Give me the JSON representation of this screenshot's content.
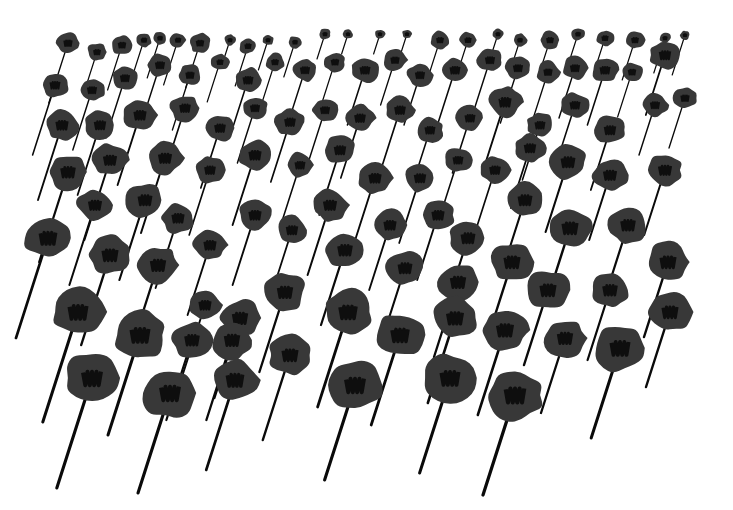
{
  "artwork": {
    "subject": "Field of dark poppies with long slanted stems",
    "background_color": "#ffffff",
    "petal_color": "#383838",
    "center_color": "#0e0e0e",
    "stem_color": "#0a0a0a",
    "stem_lean": 0.32
  },
  "flowers": [
    {
      "x": 68,
      "y": 43,
      "r": 12,
      "len": 60
    },
    {
      "x": 97,
      "y": 52,
      "r": 10,
      "len": 35
    },
    {
      "x": 122,
      "y": 45,
      "r": 11,
      "len": 45
    },
    {
      "x": 144,
      "y": 40,
      "r": 8,
      "len": 40
    },
    {
      "x": 160,
      "y": 38,
      "r": 7,
      "len": 40
    },
    {
      "x": 178,
      "y": 40,
      "r": 8,
      "len": 45
    },
    {
      "x": 200,
      "y": 43,
      "r": 11,
      "len": 45
    },
    {
      "x": 230,
      "y": 40,
      "r": 6,
      "len": 25
    },
    {
      "x": 248,
      "y": 46,
      "r": 9,
      "len": 40
    },
    {
      "x": 268,
      "y": 40,
      "r": 6,
      "len": 30
    },
    {
      "x": 295,
      "y": 42,
      "r": 7,
      "len": 35
    },
    {
      "x": 325,
      "y": 34,
      "r": 6,
      "len": 25
    },
    {
      "x": 348,
      "y": 34,
      "r": 5,
      "len": 20
    },
    {
      "x": 380,
      "y": 34,
      "r": 5,
      "len": 20
    },
    {
      "x": 407,
      "y": 34,
      "r": 5,
      "len": 20
    },
    {
      "x": 440,
      "y": 40,
      "r": 10,
      "len": 40
    },
    {
      "x": 468,
      "y": 40,
      "r": 9,
      "len": 40
    },
    {
      "x": 498,
      "y": 34,
      "r": 6,
      "len": 25
    },
    {
      "x": 520,
      "y": 40,
      "r": 7,
      "len": 30
    },
    {
      "x": 550,
      "y": 40,
      "r": 10,
      "len": 35
    },
    {
      "x": 578,
      "y": 34,
      "r": 7,
      "len": 30
    },
    {
      "x": 605,
      "y": 38,
      "r": 9,
      "len": 35
    },
    {
      "x": 635,
      "y": 40,
      "r": 10,
      "len": 40
    },
    {
      "x": 665,
      "y": 38,
      "r": 6,
      "len": 35
    },
    {
      "x": 685,
      "y": 35,
      "r": 5,
      "len": 40
    },
    {
      "x": 55,
      "y": 85,
      "r": 14,
      "len": 70
    },
    {
      "x": 92,
      "y": 90,
      "r": 13,
      "len": 60
    },
    {
      "x": 125,
      "y": 78,
      "r": 13,
      "len": 60
    },
    {
      "x": 160,
      "y": 65,
      "r": 13,
      "len": 60
    },
    {
      "x": 190,
      "y": 75,
      "r": 12,
      "len": 55
    },
    {
      "x": 220,
      "y": 62,
      "r": 9,
      "len": 40
    },
    {
      "x": 248,
      "y": 80,
      "r": 14,
      "len": 55
    },
    {
      "x": 275,
      "y": 62,
      "r": 10,
      "len": 45
    },
    {
      "x": 305,
      "y": 70,
      "r": 13,
      "len": 50
    },
    {
      "x": 335,
      "y": 62,
      "r": 11,
      "len": 45
    },
    {
      "x": 365,
      "y": 70,
      "r": 14,
      "len": 55
    },
    {
      "x": 395,
      "y": 60,
      "r": 12,
      "len": 45
    },
    {
      "x": 420,
      "y": 75,
      "r": 13,
      "len": 50
    },
    {
      "x": 455,
      "y": 70,
      "r": 14,
      "len": 55
    },
    {
      "x": 490,
      "y": 60,
      "r": 13,
      "len": 50
    },
    {
      "x": 518,
      "y": 68,
      "r": 13,
      "len": 55
    },
    {
      "x": 548,
      "y": 72,
      "r": 12,
      "len": 50
    },
    {
      "x": 575,
      "y": 68,
      "r": 13,
      "len": 50
    },
    {
      "x": 605,
      "y": 70,
      "r": 14,
      "len": 55
    },
    {
      "x": 632,
      "y": 72,
      "r": 11,
      "len": 45
    },
    {
      "x": 665,
      "y": 55,
      "r": 16,
      "len": 60
    },
    {
      "x": 685,
      "y": 98,
      "r": 12,
      "len": 50
    },
    {
      "x": 62,
      "y": 125,
      "r": 17,
      "len": 75
    },
    {
      "x": 100,
      "y": 125,
      "r": 16,
      "len": 70
    },
    {
      "x": 140,
      "y": 115,
      "r": 17,
      "len": 70
    },
    {
      "x": 185,
      "y": 108,
      "r": 15,
      "len": 65
    },
    {
      "x": 220,
      "y": 128,
      "r": 15,
      "len": 60
    },
    {
      "x": 255,
      "y": 108,
      "r": 13,
      "len": 55
    },
    {
      "x": 290,
      "y": 122,
      "r": 15,
      "len": 60
    },
    {
      "x": 325,
      "y": 110,
      "r": 13,
      "len": 55
    },
    {
      "x": 360,
      "y": 118,
      "r": 15,
      "len": 60
    },
    {
      "x": 400,
      "y": 110,
      "r": 15,
      "len": 60
    },
    {
      "x": 430,
      "y": 130,
      "r": 14,
      "len": 55
    },
    {
      "x": 470,
      "y": 118,
      "r": 14,
      "len": 55
    },
    {
      "x": 505,
      "y": 102,
      "r": 17,
      "len": 65
    },
    {
      "x": 540,
      "y": 125,
      "r": 14,
      "len": 55
    },
    {
      "x": 575,
      "y": 105,
      "r": 14,
      "len": 55
    },
    {
      "x": 610,
      "y": 130,
      "r": 16,
      "len": 60
    },
    {
      "x": 655,
      "y": 105,
      "r": 13,
      "len": 50
    },
    {
      "x": 68,
      "y": 172,
      "r": 20,
      "len": 90
    },
    {
      "x": 110,
      "y": 160,
      "r": 18,
      "len": 80
    },
    {
      "x": 165,
      "y": 158,
      "r": 18,
      "len": 75
    },
    {
      "x": 210,
      "y": 170,
      "r": 15,
      "len": 65
    },
    {
      "x": 255,
      "y": 155,
      "r": 17,
      "len": 70
    },
    {
      "x": 300,
      "y": 165,
      "r": 14,
      "len": 60
    },
    {
      "x": 340,
      "y": 150,
      "r": 16,
      "len": 65
    },
    {
      "x": 375,
      "y": 178,
      "r": 17,
      "len": 65
    },
    {
      "x": 420,
      "y": 178,
      "r": 16,
      "len": 65
    },
    {
      "x": 458,
      "y": 160,
      "r": 14,
      "len": 55
    },
    {
      "x": 495,
      "y": 170,
      "r": 15,
      "len": 60
    },
    {
      "x": 530,
      "y": 148,
      "r": 16,
      "len": 60
    },
    {
      "x": 568,
      "y": 162,
      "r": 19,
      "len": 70
    },
    {
      "x": 610,
      "y": 175,
      "r": 18,
      "len": 65
    },
    {
      "x": 665,
      "y": 170,
      "r": 18,
      "len": 65
    },
    {
      "x": 48,
      "y": 238,
      "r": 24,
      "len": 100
    },
    {
      "x": 95,
      "y": 205,
      "r": 18,
      "len": 80
    },
    {
      "x": 145,
      "y": 200,
      "r": 19,
      "len": 80
    },
    {
      "x": 178,
      "y": 218,
      "r": 17,
      "len": 70
    },
    {
      "x": 210,
      "y": 245,
      "r": 17,
      "len": 70
    },
    {
      "x": 255,
      "y": 215,
      "r": 17,
      "len": 70
    },
    {
      "x": 292,
      "y": 230,
      "r": 16,
      "len": 65
    },
    {
      "x": 330,
      "y": 205,
      "r": 18,
      "len": 70
    },
    {
      "x": 345,
      "y": 250,
      "r": 20,
      "len": 75
    },
    {
      "x": 390,
      "y": 225,
      "r": 17,
      "len": 65
    },
    {
      "x": 438,
      "y": 215,
      "r": 17,
      "len": 65
    },
    {
      "x": 468,
      "y": 238,
      "r": 19,
      "len": 70
    },
    {
      "x": 525,
      "y": 200,
      "r": 19,
      "len": 70
    },
    {
      "x": 570,
      "y": 228,
      "r": 22,
      "len": 75
    },
    {
      "x": 628,
      "y": 225,
      "r": 20,
      "len": 70
    },
    {
      "x": 668,
      "y": 262,
      "r": 22,
      "len": 75
    },
    {
      "x": 110,
      "y": 255,
      "r": 22,
      "len": 90
    },
    {
      "x": 158,
      "y": 265,
      "r": 21,
      "len": 85
    },
    {
      "x": 205,
      "y": 305,
      "r": 17,
      "len": 70
    },
    {
      "x": 240,
      "y": 318,
      "r": 21,
      "len": 80
    },
    {
      "x": 285,
      "y": 292,
      "r": 21,
      "len": 80
    },
    {
      "x": 405,
      "y": 268,
      "r": 19,
      "len": 70
    },
    {
      "x": 458,
      "y": 282,
      "r": 21,
      "len": 75
    },
    {
      "x": 512,
      "y": 262,
      "r": 22,
      "len": 75
    },
    {
      "x": 548,
      "y": 290,
      "r": 22,
      "len": 75
    },
    {
      "x": 610,
      "y": 290,
      "r": 20,
      "len": 70
    },
    {
      "x": 670,
      "y": 312,
      "r": 22,
      "len": 75
    },
    {
      "x": 78,
      "y": 312,
      "r": 27,
      "len": 110
    },
    {
      "x": 140,
      "y": 335,
      "r": 27,
      "len": 100
    },
    {
      "x": 192,
      "y": 340,
      "r": 20,
      "len": 80
    },
    {
      "x": 232,
      "y": 340,
      "r": 21,
      "len": 80
    },
    {
      "x": 290,
      "y": 355,
      "r": 22,
      "len": 85
    },
    {
      "x": 348,
      "y": 312,
      "r": 25,
      "len": 95
    },
    {
      "x": 400,
      "y": 335,
      "r": 25,
      "len": 90
    },
    {
      "x": 455,
      "y": 318,
      "r": 23,
      "len": 85
    },
    {
      "x": 505,
      "y": 330,
      "r": 23,
      "len": 85
    },
    {
      "x": 565,
      "y": 338,
      "r": 21,
      "len": 75
    },
    {
      "x": 620,
      "y": 348,
      "r": 27,
      "len": 90
    },
    {
      "x": 92,
      "y": 378,
      "r": 28,
      "len": 110
    },
    {
      "x": 170,
      "y": 393,
      "r": 28,
      "len": 100
    },
    {
      "x": 235,
      "y": 380,
      "r": 24,
      "len": 90
    },
    {
      "x": 355,
      "y": 385,
      "r": 28,
      "len": 95
    },
    {
      "x": 450,
      "y": 378,
      "r": 27,
      "len": 95
    },
    {
      "x": 515,
      "y": 395,
      "r": 29,
      "len": 100
    }
  ]
}
